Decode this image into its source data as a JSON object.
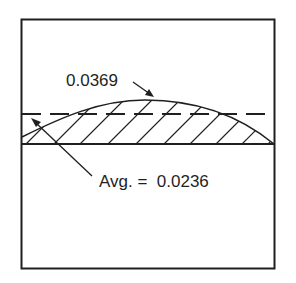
{
  "diagram": {
    "peak_label": "0.0369",
    "average_label": "Avg. =  0.0236",
    "colors": {
      "ink": "#1f1f1f",
      "background": "#ffffff"
    },
    "elements": [
      "outer frame",
      "solid baseline",
      "dashed average line",
      "hatched area under curve",
      "arrow to curve peak",
      "arrow to dashed average line"
    ]
  }
}
